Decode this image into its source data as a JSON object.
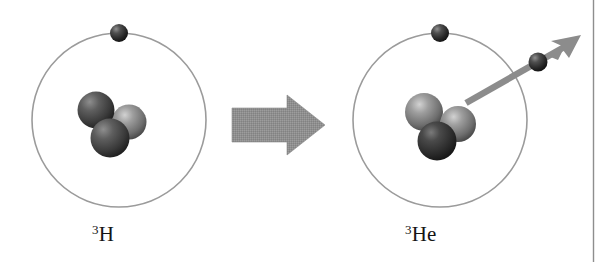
{
  "figure": {
    "background_color": "#ffffff",
    "border_line_color": "#8a8a8a"
  },
  "left_atom": {
    "name": "tritium-atom",
    "label_mass": "3",
    "label_symbol": "H",
    "label_full": "3H",
    "orbit": {
      "cx": 119,
      "cy": 120,
      "r": 87,
      "stroke": "#9b9b9b"
    },
    "electron": {
      "cx": 119,
      "cy": 33,
      "r": 9,
      "color": "#262626"
    },
    "nucleons": [
      {
        "name": "neutron-upper-left",
        "cx": 96,
        "cy": 110,
        "r": 18,
        "shade": "dark",
        "color": "#4a4a4a"
      },
      {
        "name": "proton-right",
        "cx": 129,
        "cy": 122,
        "r": 17,
        "shade": "light",
        "color": "#7d7d7d"
      },
      {
        "name": "neutron-lower",
        "cx": 110,
        "cy": 137,
        "r": 19,
        "shade": "dark",
        "color": "#3f3f3f"
      }
    ]
  },
  "right_atom": {
    "name": "helium3-atom",
    "label_mass": "3",
    "label_symbol": "He",
    "label_full": "3He",
    "orbit": {
      "cx": 440,
      "cy": 120,
      "r": 87,
      "stroke": "#9b9b9b"
    },
    "electron": {
      "cx": 440,
      "cy": 33,
      "r": 9,
      "color": "#262626"
    },
    "nucleons": [
      {
        "name": "proton-upper-left",
        "cx": 424,
        "cy": 112,
        "r": 19,
        "shade": "light",
        "color": "#6f6f6f"
      },
      {
        "name": "proton-right",
        "cx": 457,
        "cy": 124,
        "r": 18,
        "shade": "light",
        "color": "#777777"
      },
      {
        "name": "neutron-lower",
        "cx": 437,
        "cy": 140,
        "r": 19,
        "shade": "dark",
        "color": "#343434"
      }
    ]
  },
  "transition_arrow": {
    "name": "reaction-arrow",
    "direction": "right",
    "color": "#8f8f8f",
    "x": 232,
    "y": 95,
    "width": 93,
    "height": 60
  },
  "emission": {
    "name": "beta-particle-emission",
    "arrow_color": "#8c8c8c",
    "start_x": 465,
    "start_y": 102,
    "end_x": 578,
    "end_y": 38,
    "particle": {
      "name": "beta-particle",
      "cx": 538,
      "cy": 62,
      "r": 9,
      "color": "#2b2b2b"
    }
  },
  "panel_border": {
    "name": "page-edge-line",
    "x": 593,
    "y_top": 0,
    "y_bottom": 262,
    "color": "#8e8e8e"
  }
}
